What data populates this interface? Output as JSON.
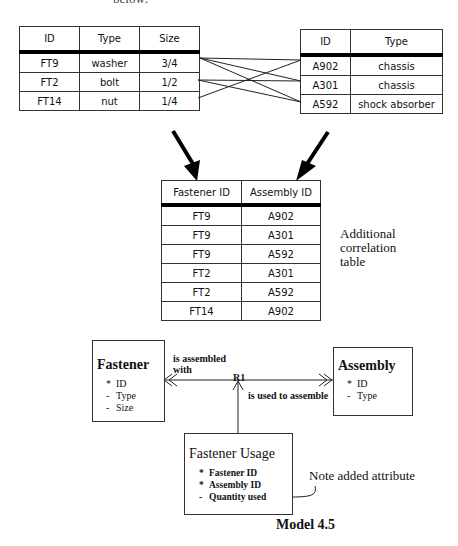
{
  "header": {
    "cut_text": "below:"
  },
  "fastener_table": {
    "columns": [
      "ID",
      "Type",
      "Size"
    ],
    "rows": [
      [
        "FT9",
        "washer",
        "3/4"
      ],
      [
        "FT2",
        "bolt",
        "1/2"
      ],
      [
        "FT14",
        "nut",
        "1/4"
      ]
    ]
  },
  "assembly_table": {
    "columns": [
      "ID",
      "Type"
    ],
    "rows": [
      [
        "A902",
        "chassis"
      ],
      [
        "A301",
        "chassis"
      ],
      [
        "A592",
        "shock absorber"
      ]
    ]
  },
  "correlation_table": {
    "columns": [
      "Fastener ID",
      "Assembly ID"
    ],
    "rows": [
      [
        "FT9",
        "A902"
      ],
      [
        "FT9",
        "A301"
      ],
      [
        "FT9",
        "A592"
      ],
      [
        "FT2",
        "A301"
      ],
      [
        "FT2",
        "A592"
      ],
      [
        "FT14",
        "A902"
      ]
    ],
    "caption_lines": [
      "Additional",
      "correlation",
      "table"
    ]
  },
  "links": [
    {
      "from": "FT9",
      "to": "A902"
    },
    {
      "from": "FT9",
      "to": "A301"
    },
    {
      "from": "FT9",
      "to": "A592"
    },
    {
      "from": "FT2",
      "to": "A301"
    },
    {
      "from": "FT2",
      "to": "A592"
    },
    {
      "from": "FT14",
      "to": "A902"
    }
  ],
  "model": {
    "fastener": {
      "title": "Fastener",
      "attributes": [
        {
          "marker": "*",
          "name": "ID"
        },
        {
          "marker": "-",
          "name": "Type"
        },
        {
          "marker": "-",
          "name": "Size"
        }
      ]
    },
    "assembly": {
      "title": "Assembly",
      "attributes": [
        {
          "marker": "*",
          "name": "ID"
        },
        {
          "marker": "-",
          "name": "Type"
        }
      ]
    },
    "fastener_usage": {
      "title": "Fastener Usage",
      "attributes": [
        {
          "marker": "*",
          "name": "Fastener ID"
        },
        {
          "marker": "*",
          "name": "Assembly ID"
        },
        {
          "marker": "-",
          "name": "Quantity used"
        }
      ]
    },
    "relationship": {
      "id": "R1",
      "phrase_left_line1": "is assembled",
      "phrase_left_line2": "with",
      "phrase_right": "is used to assemble"
    },
    "note": "Note added attribute",
    "caption": "Model 4.5"
  }
}
